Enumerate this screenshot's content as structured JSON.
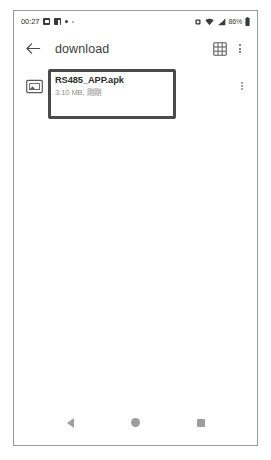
{
  "status_bar": {
    "time": "00:27",
    "left_icons": [
      "screenshot-icon",
      "facebook-icon",
      "dot-icon",
      "dot-small-icon"
    ],
    "right_icons": [
      "vibrate-icon",
      "wifi-icon",
      "signal-icon",
      "battery-icon"
    ],
    "battery_text": "86%"
  },
  "app_bar": {
    "back_icon": "arrow-back-icon",
    "title": "download",
    "grid_icon": "grid-view-icon",
    "overflow_icon": "overflow-menu-icon"
  },
  "files": [
    {
      "thumb_icon": "image-file-icon",
      "name": "RS485_APP.apk",
      "meta": "3.10 MB, 剛剛",
      "menu_icon": "row-overflow-icon"
    }
  ],
  "annotation": {
    "label": "highlight-box",
    "color": "#4a4a4a"
  },
  "nav_bar": {
    "back_label": "back-triangle-icon",
    "home_label": "home-circle-icon",
    "recents_label": "recents-square-icon"
  }
}
